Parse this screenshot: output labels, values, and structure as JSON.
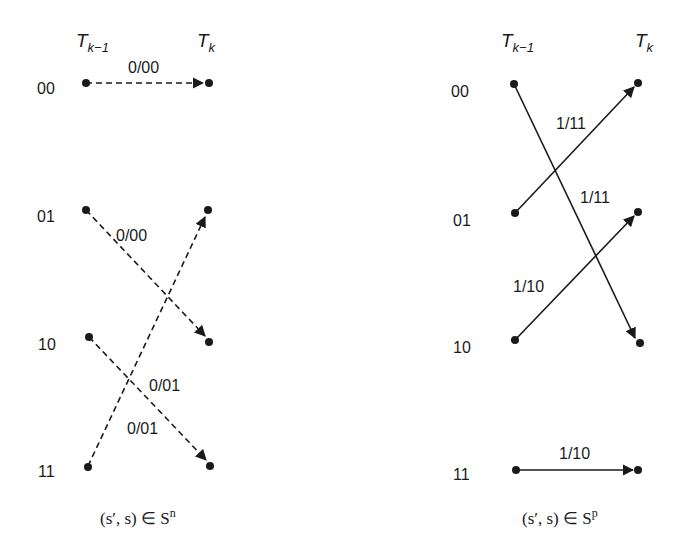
{
  "panels": [
    {
      "id": "normal",
      "time_left": {
        "base": "T",
        "sub": "k−1"
      },
      "time_right": {
        "base": "T",
        "sub": "k"
      },
      "states": [
        "00",
        "01",
        "10",
        "11"
      ],
      "line_style": "dashed",
      "edges": [
        {
          "from": "00",
          "to": "00",
          "label": "0/00"
        },
        {
          "from": "01",
          "to": "10",
          "label": "0/00"
        },
        {
          "from": "10",
          "to": "11",
          "label": "0/01"
        },
        {
          "from": "11",
          "to": "01",
          "label": "0/01"
        }
      ],
      "caption": {
        "text": "(s′, s) ∈ S",
        "sup": "n"
      }
    },
    {
      "id": "parallel",
      "time_left": {
        "base": "T",
        "sub": "k−1"
      },
      "time_right": {
        "base": "T",
        "sub": "k"
      },
      "states": [
        "00",
        "01",
        "10",
        "11"
      ],
      "line_style": "solid",
      "edges": [
        {
          "from": "00",
          "to": "10",
          "label": "1/11"
        },
        {
          "from": "01",
          "to": "00",
          "label": "1/11"
        },
        {
          "from": "10",
          "to": "01",
          "label": "1/10"
        },
        {
          "from": "11",
          "to": "11",
          "label": "1/10"
        }
      ],
      "caption": {
        "text": "(s′, s) ∈ S",
        "sup": "p"
      }
    }
  ],
  "colors": {
    "ink": "#1a1a1a",
    "background": "#ffffff"
  }
}
